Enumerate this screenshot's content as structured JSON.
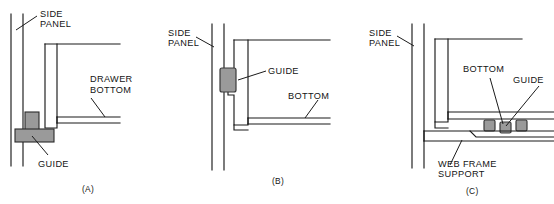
{
  "figure": {
    "name": "drawer-guide-construction-details",
    "panel_count": 3
  },
  "colors": {
    "line": "#1b1b1b",
    "guide_fill": "#9a9a9a",
    "guide_stroke": "#2a2a2a",
    "background": "#ffffff",
    "text": "#141414"
  },
  "panels": [
    {
      "id": "A",
      "caption": "(A)",
      "labels": {
        "side_panel_line1": "SIDE",
        "side_panel_line2": "PANEL",
        "drawer_bottom_line1": "DRAWER",
        "drawer_bottom_line2": "BOTTOM",
        "guide": "GUIDE"
      },
      "parts": [
        "side-panel",
        "drawer-side",
        "drawer-bottom",
        "guide-block"
      ]
    },
    {
      "id": "B",
      "caption": "(B)",
      "labels": {
        "side_panel_line1": "SIDE",
        "side_panel_line2": "PANEL",
        "guide": "GUIDE",
        "bottom": "BOTTOM"
      },
      "parts": [
        "side-panel",
        "drawer-side-notched",
        "drawer-bottom",
        "guide-block"
      ]
    },
    {
      "id": "C",
      "caption": "(C)",
      "labels": {
        "side_panel_line1": "SIDE",
        "side_panel_line2": "PANEL",
        "bottom": "BOTTOM",
        "guide": "GUIDE",
        "web_frame_line1": "WEB FRAME",
        "web_frame_line2": "SUPPORT"
      },
      "parts": [
        "side-panel",
        "drawer-side",
        "drawer-bottom",
        "guide-block-left",
        "guide-block-center",
        "guide-block-right",
        "web-frame-support"
      ]
    }
  ]
}
